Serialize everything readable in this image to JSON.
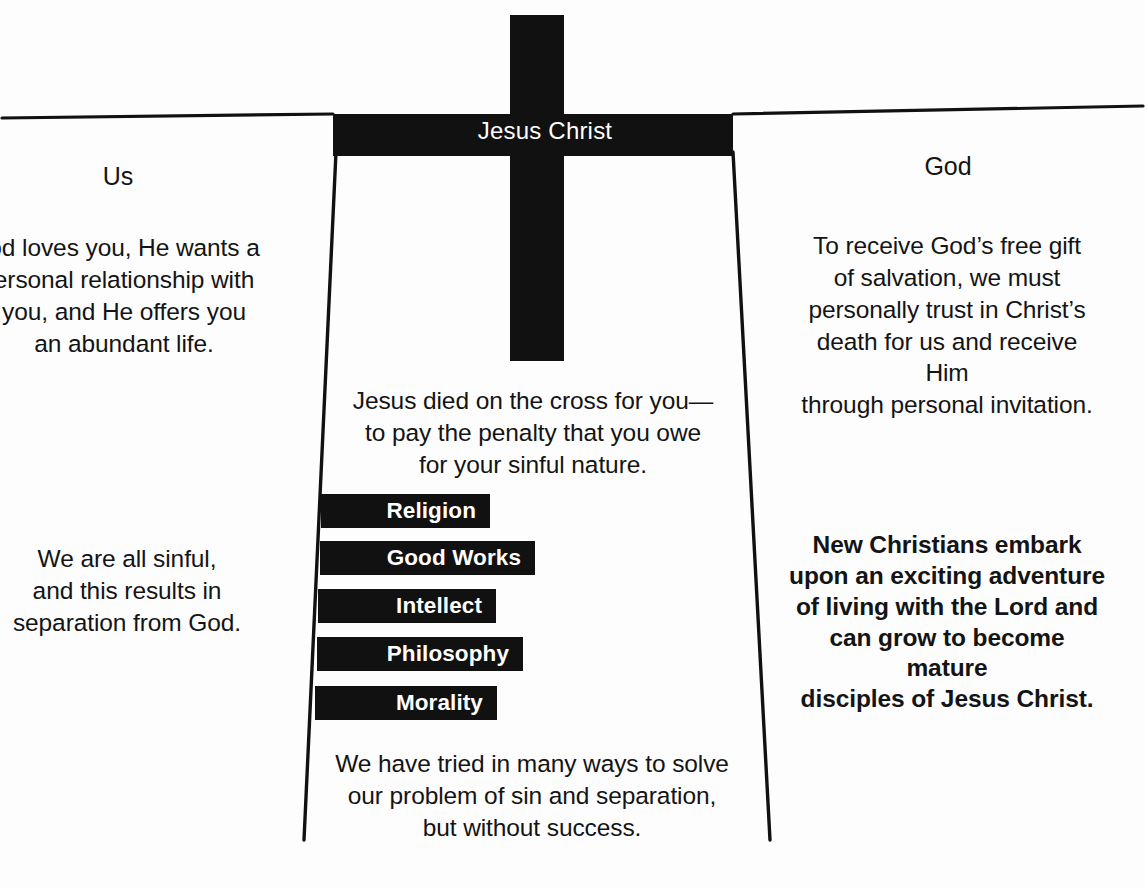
{
  "illustration": {
    "title": "The Bridge Illustration",
    "cross_label": "Jesus Christ"
  },
  "left": {
    "heading": "Us",
    "top_text": "od loves you, He wants a\nersonal relationship with\nyou, and He offers you\nan abundant life.",
    "mid_text": "We are all sinful,\nand this results in\nseparation from God."
  },
  "right": {
    "heading": "God",
    "top_text": "To receive God’s free gift\nof salvation, we must\npersonally trust in Christ’s\ndeath for us and receive Him\nthrough personal invitation.",
    "bold_text": "New Christians embark\nupon an exciting adventure\nof living with the Lord and\ncan grow to become mature\ndisciples of Jesus Christ."
  },
  "center": {
    "top_text": "Jesus died on the cross for you—\nto pay the penalty that you owe\nfor your sinful nature.",
    "bottom_text": "We have tried in many ways to solve\nour problem of sin and separation,\nbut without success."
  },
  "bars": [
    {
      "label": "Religion",
      "top": 494,
      "height": 34,
      "left": 321,
      "right": 490
    },
    {
      "label": "Good Works",
      "top": 541,
      "height": 34,
      "left": 320,
      "right": 535
    },
    {
      "label": "Intellect",
      "top": 589,
      "height": 34,
      "left": 318,
      "right": 496
    },
    {
      "label": "Philosophy",
      "top": 637,
      "height": 34,
      "left": 317,
      "right": 523
    },
    {
      "label": "Morality",
      "top": 686,
      "height": 34,
      "left": 315,
      "right": 497
    }
  ],
  "colors": {
    "ink": "#111111",
    "paper": "#ffffff",
    "text": "#141414"
  }
}
